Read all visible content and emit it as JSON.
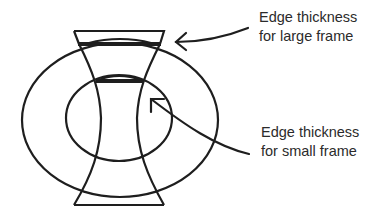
{
  "diagram": {
    "colors": {
      "stroke": "#1e1e1e",
      "text": "#2b2b2b",
      "background": "#ffffff"
    },
    "labels": {
      "large_frame": {
        "line1": "Edge thickness",
        "line2": "for large frame"
      },
      "small_frame": {
        "line1": "Edge thickness",
        "line2": "for small frame"
      }
    },
    "elements": {
      "large_frame": "outer-ellipse",
      "small_frame": "inner-ellipse",
      "lens_profile": "concave-lens-cross-section"
    }
  }
}
